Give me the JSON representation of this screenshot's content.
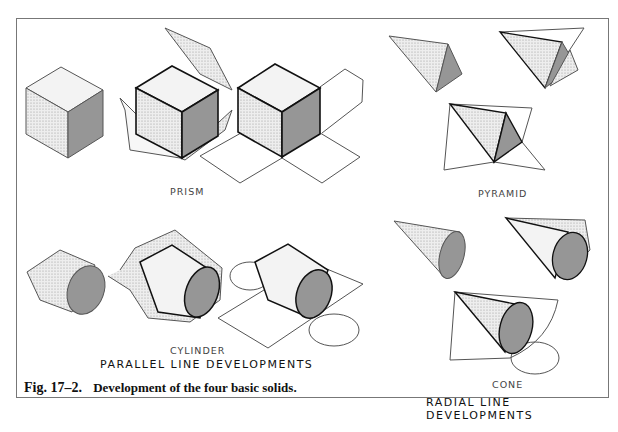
{
  "figure": {
    "number": "Fig. 17–2.",
    "caption": "Development of the four basic solids.",
    "sections": {
      "parallel": {
        "heading": "PARALLEL LINE DEVELOPMENTS",
        "solids": [
          "PRISM",
          "CYLINDER"
        ]
      },
      "radial": {
        "heading": "RADIAL LINE DEVELOPMENTS",
        "solids": [
          "PYRAMID",
          "CONE"
        ]
      }
    }
  },
  "colors": {
    "line": "#333333",
    "bold_line": "#111111",
    "light_shade": "#e6e6e6",
    "mid_shade": "#c8c8c8",
    "dark_shade": "#9a9a9a",
    "frame": "#777777"
  }
}
